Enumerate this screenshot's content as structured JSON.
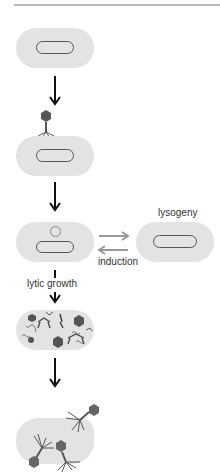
{
  "diagram": {
    "labels": {
      "lysogeny": "lysogeny",
      "induction": "induction",
      "lytic_growth": "lytic growth"
    },
    "stages": [
      {
        "id": "uninfected-cell",
        "description": "Bacterial cell with chromosome"
      },
      {
        "id": "phage-attachment",
        "description": "Phage attaches to cell"
      },
      {
        "id": "phage-dna-injected",
        "description": "Phage DNA (circle) inside cell"
      },
      {
        "id": "lysogen",
        "description": "Prophage integrated in chromosome"
      },
      {
        "id": "phage-assembly",
        "description": "Phage parts replicate and assemble"
      },
      {
        "id": "cell-lysis",
        "description": "Cell bursts releasing phages"
      }
    ],
    "colors": {
      "cell": "#e3e3e3",
      "outline": "#555555",
      "phage": "#555555",
      "gray_arrow": "#999999",
      "black_arrow": "#111111"
    }
  }
}
